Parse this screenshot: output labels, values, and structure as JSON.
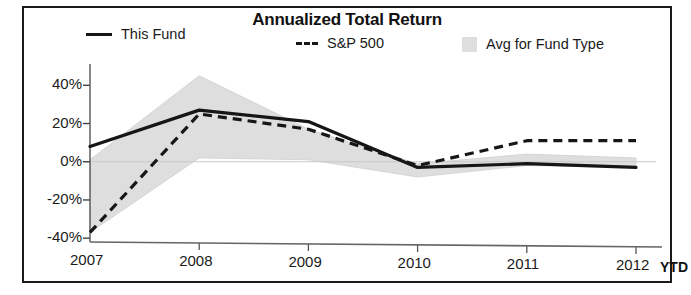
{
  "chart_data": {
    "type": "line",
    "title": "Annualized Total Return",
    "xlabel": "",
    "ylabel": "",
    "categories": [
      "2007",
      "2008",
      "2009",
      "2010",
      "2011",
      "2012"
    ],
    "x_axis_suffix": "YTD",
    "ytick_labels": [
      "40%",
      "20%",
      "0%",
      "-20%",
      "-40%"
    ],
    "ytick_values": [
      40,
      20,
      0,
      -20,
      -40
    ],
    "ylim": [
      -42,
      48
    ],
    "grid": false,
    "legend_position": "top",
    "series": [
      {
        "name": "This Fund",
        "style": "solid-line",
        "color": "#161616",
        "values": [
          8,
          27,
          21,
          -3,
          -1,
          -3
        ]
      },
      {
        "name": "S&P 500",
        "style": "dashed-line",
        "color": "#161616",
        "values": [
          -37,
          25,
          17,
          -2,
          11,
          11
        ]
      },
      {
        "name": "Avg for Fund Type",
        "style": "shaded-band",
        "color": "#dedede",
        "upper": [
          1,
          45,
          17,
          -1,
          4,
          2
        ],
        "lower": [
          -37,
          2,
          1,
          -8,
          -2,
          -3
        ]
      }
    ]
  },
  "legend": {
    "items": [
      {
        "label": "This Fund",
        "swatch": "solid-line-swatch"
      },
      {
        "label": "S&P 500",
        "swatch": "dashed-line-swatch"
      },
      {
        "label": "Avg for Fund Type",
        "swatch": "area-swatch"
      }
    ]
  }
}
